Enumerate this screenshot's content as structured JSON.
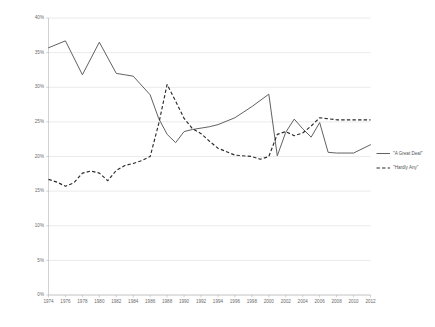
{
  "chart_data": {
    "type": "line",
    "title": "",
    "xlabel": "",
    "ylabel": "",
    "ylim": [
      0,
      40
    ],
    "ytick_labels": [
      "0%",
      "5%",
      "10%",
      "15%",
      "20%",
      "25%",
      "30%",
      "35%",
      "40%"
    ],
    "ytick_values": [
      0,
      5,
      10,
      15,
      20,
      25,
      30,
      35,
      40
    ],
    "grid": true,
    "legend_position": "right",
    "categories": [
      1974,
      1975,
      1976,
      1977,
      1978,
      1979,
      1980,
      1981,
      1982,
      1983,
      1984,
      1985,
      1986,
      1987,
      1988,
      1989,
      1990,
      1991,
      1992,
      1993,
      1994,
      1995,
      1996,
      1997,
      1998,
      1999,
      2000,
      2001,
      2002,
      2003,
      2004,
      2005,
      2006,
      2007,
      2008,
      2009,
      2010,
      2011,
      2012
    ],
    "xtick_labels": [
      "1974",
      "1976",
      "1978",
      "1980",
      "1982",
      "1984",
      "1986",
      "1988",
      "1990",
      "1992",
      "1994",
      "1996",
      "1998",
      "2000",
      "2002",
      "2004",
      "2006",
      "2008",
      "2010",
      "2012"
    ],
    "xtick_values": [
      1974,
      1976,
      1978,
      1980,
      1982,
      1984,
      1986,
      1988,
      1990,
      1992,
      1994,
      1996,
      1998,
      2000,
      2002,
      2004,
      2006,
      2008,
      2010,
      2012
    ],
    "series": [
      {
        "name": "\"A Great Deal\"",
        "style": "solid",
        "color": "#595959",
        "points": [
          {
            "x": 1974,
            "y": 35.7
          },
          {
            "x": 1976,
            "y": 36.7
          },
          {
            "x": 1978,
            "y": 31.8
          },
          {
            "x": 1980,
            "y": 36.5
          },
          {
            "x": 1982,
            "y": 32.0
          },
          {
            "x": 1983,
            "y": 31.8
          },
          {
            "x": 1984,
            "y": 31.6
          },
          {
            "x": 1986,
            "y": 28.9
          },
          {
            "x": 1987,
            "y": 25.5
          },
          {
            "x": 1988,
            "y": 23.2
          },
          {
            "x": 1989,
            "y": 22.0
          },
          {
            "x": 1990,
            "y": 23.6
          },
          {
            "x": 1991,
            "y": 23.9
          },
          {
            "x": 1993,
            "y": 24.3
          },
          {
            "x": 1994,
            "y": 24.6
          },
          {
            "x": 1996,
            "y": 25.6
          },
          {
            "x": 1998,
            "y": 27.2
          },
          {
            "x": 2000,
            "y": 29.0
          },
          {
            "x": 2001,
            "y": 20.1
          },
          {
            "x": 2002,
            "y": 23.5
          },
          {
            "x": 2003,
            "y": 25.4
          },
          {
            "x": 2004,
            "y": 24.0
          },
          {
            "x": 2005,
            "y": 22.8
          },
          {
            "x": 2006,
            "y": 24.9
          },
          {
            "x": 2007,
            "y": 20.6
          },
          {
            "x": 2008,
            "y": 20.5
          },
          {
            "x": 2010,
            "y": 20.5
          },
          {
            "x": 2012,
            "y": 21.7
          }
        ]
      },
      {
        "name": "\"Hardly Any\"",
        "style": "dashed",
        "color": "#2b2b2b",
        "points": [
          {
            "x": 1974,
            "y": 16.7
          },
          {
            "x": 1975,
            "y": 16.3
          },
          {
            "x": 1976,
            "y": 15.7
          },
          {
            "x": 1977,
            "y": 16.2
          },
          {
            "x": 1978,
            "y": 17.6
          },
          {
            "x": 1979,
            "y": 17.9
          },
          {
            "x": 1980,
            "y": 17.6
          },
          {
            "x": 1981,
            "y": 16.5
          },
          {
            "x": 1982,
            "y": 18.0
          },
          {
            "x": 1983,
            "y": 18.7
          },
          {
            "x": 1984,
            "y": 19.0
          },
          {
            "x": 1985,
            "y": 19.4
          },
          {
            "x": 1986,
            "y": 20.0
          },
          {
            "x": 1987,
            "y": 24.7
          },
          {
            "x": 1988,
            "y": 30.4
          },
          {
            "x": 1989,
            "y": 28.0
          },
          {
            "x": 1990,
            "y": 25.5
          },
          {
            "x": 1991,
            "y": 24.0
          },
          {
            "x": 1992,
            "y": 23.3
          },
          {
            "x": 1993,
            "y": 22.2
          },
          {
            "x": 1994,
            "y": 21.2
          },
          {
            "x": 1996,
            "y": 20.2
          },
          {
            "x": 1998,
            "y": 20.0
          },
          {
            "x": 1999,
            "y": 19.6
          },
          {
            "x": 2000,
            "y": 20.0
          },
          {
            "x": 2001,
            "y": 23.2
          },
          {
            "x": 2002,
            "y": 23.6
          },
          {
            "x": 2003,
            "y": 23.0
          },
          {
            "x": 2004,
            "y": 23.4
          },
          {
            "x": 2005,
            "y": 24.4
          },
          {
            "x": 2006,
            "y": 25.6
          },
          {
            "x": 2008,
            "y": 25.3
          },
          {
            "x": 2010,
            "y": 25.3
          },
          {
            "x": 2012,
            "y": 25.3
          }
        ]
      }
    ]
  },
  "legend": {
    "entries": [
      {
        "label": "\"A Great Deal\"",
        "style": "solid"
      },
      {
        "label": "\"Hardly Any\"",
        "style": "dashed"
      }
    ]
  }
}
